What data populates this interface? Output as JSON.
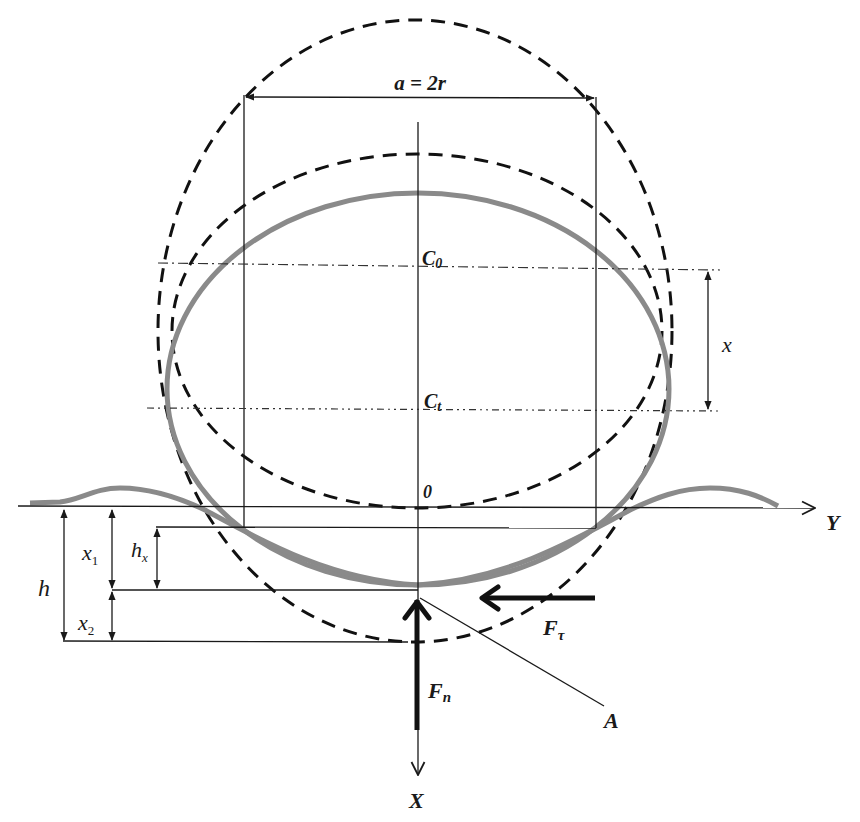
{
  "diagram": {
    "labels": {
      "width": "a = 2r",
      "center_initial": "C",
      "center_initial_sub": "0",
      "center_deformed": "C",
      "center_deformed_sub": "t",
      "center_offset": "x",
      "origin": "0",
      "axis_y": "Y",
      "axis_x": "X",
      "depth_total": "h",
      "depth_x1": "x",
      "depth_x1_sub": "1",
      "depth_x2": "x",
      "depth_x2_sub": "2",
      "depth_hx": "h",
      "depth_hx_sub": "x",
      "force_tangential": "F",
      "force_tangential_sub": "τ",
      "force_normal": "F",
      "force_normal_sub": "n",
      "point_a": "A"
    },
    "elements": [
      "large dashed circle (undeformed wheel, center C0)",
      "small dashed circle (center Ct)",
      "gray deformed tire ellipse",
      "gray soil surface profile with bulges",
      "horizontal Y axis",
      "vertical X axis",
      "dimension arrows h, x1, x2, hx, x, a = 2r",
      "force arrows Fn (up) and Fτ (left)",
      "leader line to point A"
    ],
    "colors": {
      "line": "#1a1a1a",
      "tire": "#8a8a8a",
      "background": "#ffffff"
    }
  }
}
